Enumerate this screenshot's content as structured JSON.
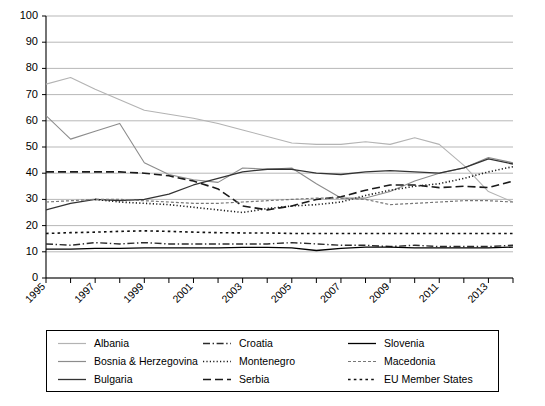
{
  "chart_data": {
    "type": "line",
    "title": "",
    "xlabel": "",
    "ylabel": "",
    "ylim": [
      0,
      100
    ],
    "ytick_values": [
      0,
      10,
      20,
      30,
      40,
      50,
      60,
      70,
      80,
      90,
      100
    ],
    "grid": true,
    "legend_position": "bottom",
    "x": [
      1995,
      1996,
      1997,
      1998,
      1999,
      2000,
      2001,
      2002,
      2003,
      2004,
      2005,
      2006,
      2007,
      2008,
      2009,
      2010,
      2011,
      2012,
      2013,
      2014
    ],
    "xtick_labels": [
      "1995",
      "1997",
      "1999",
      "2001",
      "2003",
      "2005",
      "2007",
      "2009",
      "2011",
      "2013"
    ],
    "xtick_values": [
      1995,
      1997,
      1999,
      2001,
      2003,
      2005,
      2007,
      2009,
      2011,
      2013
    ],
    "series": [
      {
        "name": "Albania",
        "color": "#b3b3b3",
        "dash": "none",
        "width": 1.1,
        "values": [
          74,
          76.5,
          72,
          68,
          64,
          62.5,
          61,
          59,
          56.5,
          54,
          51.5,
          51,
          51,
          52,
          51,
          53.5,
          51,
          43,
          33,
          29
        ]
      },
      {
        "name": "Bosnia & Herzegovina",
        "color": "#8c8c8c",
        "dash": "none",
        "width": 1.1,
        "values": [
          62,
          53,
          56,
          59,
          44,
          39.5,
          37.5,
          36.5,
          42,
          41.5,
          42,
          36,
          30.5,
          30.5,
          33,
          37,
          40,
          42,
          46,
          44
        ]
      },
      {
        "name": "Bulgaria",
        "color": "#333333",
        "dash": "none",
        "width": 1.3,
        "values": [
          26,
          28.5,
          30,
          29.5,
          30,
          32,
          35.5,
          38,
          40.5,
          41.5,
          41.5,
          40,
          39.5,
          40.5,
          41,
          40.5,
          40,
          42,
          45.5,
          43.5
        ]
      },
      {
        "name": "Croatia",
        "color": "#2b2b2b",
        "dash": "dashdot",
        "width": 1.4,
        "values": [
          13,
          12.5,
          13.5,
          13,
          13.5,
          13,
          13,
          13,
          13,
          13,
          13.5,
          13,
          12.5,
          12.5,
          12,
          12.5,
          12,
          12,
          12,
          12.5
        ]
      },
      {
        "name": "Montenegro",
        "color": "#1a1a1a",
        "dash": "dotted",
        "width": 1.6,
        "values": [
          null,
          null,
          30,
          29,
          28.5,
          28,
          27,
          26,
          25,
          26.5,
          27.5,
          28,
          29,
          31.5,
          33.5,
          35,
          36,
          38,
          40.5,
          42.5
        ]
      },
      {
        "name": "Serbia",
        "color": "#1a1a1a",
        "dash": "longdash",
        "width": 1.6,
        "values": [
          40.5,
          40.5,
          40.5,
          40.5,
          40,
          39,
          37,
          34,
          27.5,
          26,
          27.5,
          30,
          31,
          33.5,
          35.5,
          35.5,
          34.5,
          35,
          34.5,
          37
        ]
      },
      {
        "name": "Slovenia",
        "color": "#000000",
        "dash": "none",
        "width": 1.3,
        "values": [
          11,
          11,
          11.3,
          11.3,
          11.5,
          11.5,
          11.5,
          11.5,
          11.7,
          11.7,
          11.5,
          10.5,
          11.3,
          11.8,
          11.8,
          11.5,
          11.5,
          11.5,
          11.5,
          11.8
        ]
      },
      {
        "name": "Macedonia",
        "color": "#777777",
        "dash": "finedash",
        "width": 1.2,
        "values": [
          29,
          29.5,
          30,
          30,
          29.5,
          29,
          28.5,
          28.5,
          29,
          29.5,
          30,
          30.5,
          30.5,
          30,
          28,
          28.5,
          29,
          29.5,
          29.5,
          29
        ]
      },
      {
        "name": "EU Member States",
        "color": "#111111",
        "dash": "squaredot",
        "width": 1.6,
        "values": [
          17,
          17.3,
          17.5,
          17.8,
          18,
          17.8,
          17.5,
          17.3,
          17.2,
          17.2,
          17,
          17,
          17,
          17,
          17,
          17,
          17,
          17,
          17,
          17
        ]
      }
    ]
  },
  "legend": {
    "items": [
      {
        "label": "Albania"
      },
      {
        "label": "Croatia"
      },
      {
        "label": "Slovenia"
      },
      {
        "label": "Bosnia & Herzegovina"
      },
      {
        "label": "Montenegro"
      },
      {
        "label": "Macedonia"
      },
      {
        "label": "Bulgaria"
      },
      {
        "label": "Serbia"
      },
      {
        "label": "EU Member States"
      }
    ],
    "order": [
      0,
      3,
      6,
      1,
      4,
      7,
      2,
      5,
      8
    ]
  }
}
